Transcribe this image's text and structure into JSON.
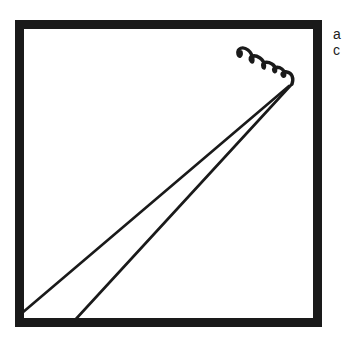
{
  "figure": {
    "stroke_color": "#1a1a1a",
    "background": "#ffffff",
    "frame": {
      "x": 15,
      "y": 20,
      "width": 307,
      "height": 307,
      "thickness": 9
    },
    "lines": [
      {
        "from": [
          20,
          313
        ],
        "to": [
          289,
          86
        ]
      },
      {
        "from": [
          75,
          321
        ],
        "to": [
          292,
          84
        ]
      }
    ],
    "coil": {
      "start": [
        238,
        48
      ],
      "end": [
        292,
        80
      ],
      "loops": 5
    }
  },
  "edge_text": {
    "line1": "a",
    "line2": "c"
  }
}
